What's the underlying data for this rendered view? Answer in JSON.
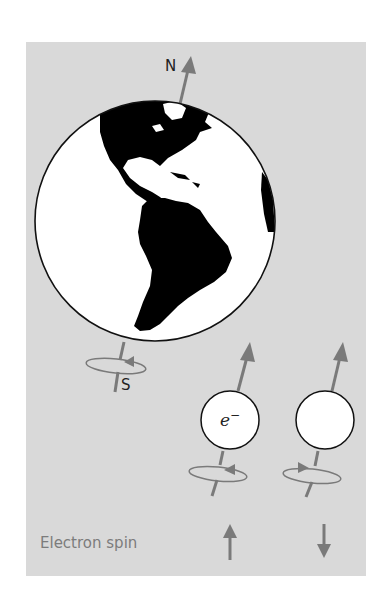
{
  "figure": {
    "title": "Electron spin",
    "earth": {
      "north_label": "N",
      "south_label": "S",
      "spin_direction": "counterclockwise (viewed from above)"
    },
    "electrons": [
      {
        "symbol": "e",
        "charge": "−",
        "spin_label": "up",
        "spin_arrow": "↑"
      },
      {
        "symbol": "",
        "charge": "",
        "spin_label": "down",
        "spin_arrow": "↓"
      }
    ],
    "colors": {
      "panel": "#d9d9d9",
      "arrow": "#7a7a7a",
      "land": "#000000",
      "ocean": "#ffffff",
      "caption": "#7c7c7c"
    }
  }
}
